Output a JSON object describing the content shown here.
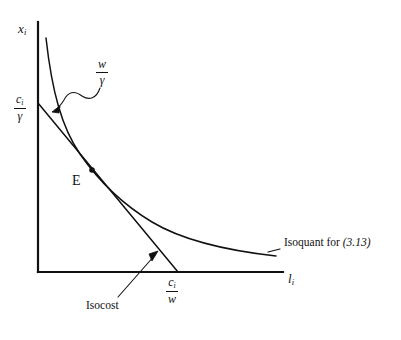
{
  "figure": {
    "background_color": "#ffffff",
    "line_color": "#111111",
    "width": 401,
    "height": 340
  },
  "axes": {
    "y_axis_label": "x",
    "y_axis_subscript": "i",
    "x_axis_label": "l",
    "x_axis_subscript": "i",
    "origin": {
      "x": 38,
      "y": 272
    },
    "x_axis_end": {
      "x": 283,
      "y": 272
    },
    "y_axis_top": {
      "x": 38,
      "y": 22
    }
  },
  "intercepts": {
    "vertical": {
      "numerator": "c",
      "numerator_subscript": "i",
      "denominator": "γ",
      "value_label": "c_i/γ",
      "position": {
        "x": 14,
        "y": 95
      }
    },
    "horizontal": {
      "numerator": "c",
      "numerator_subscript": "i",
      "denominator": "w",
      "value_label": "c_i/w",
      "position": {
        "x": 166,
        "y": 277
      }
    }
  },
  "slope_annotation": {
    "numerator": "w",
    "denominator": "γ",
    "value_label": "w/γ",
    "position": {
      "x": 96,
      "y": 60
    },
    "points_to": {
      "x": 53,
      "y": 110
    }
  },
  "equilibrium_point": {
    "label": "E",
    "marker": "filled-dot",
    "dot": {
      "x": 92,
      "y": 170
    },
    "label_position": {
      "x": 72,
      "y": 180
    }
  },
  "curves": [
    {
      "name": "isoquant",
      "label": "Isoquant for",
      "equation_reference": "(3.13)",
      "label_position": {
        "x": 283,
        "y": 243
      },
      "shape": "convex-hyperbola",
      "start": {
        "x": 46,
        "y": 38
      },
      "end": {
        "x": 276,
        "y": 256
      }
    },
    {
      "name": "isocost",
      "label": "Isocost",
      "label_position": {
        "x": 86,
        "y": 305
      },
      "shape": "straight-line",
      "start": {
        "x": 38,
        "y": 103
      },
      "end": {
        "x": 178,
        "y": 272
      },
      "pointer_to": {
        "x": 152,
        "y": 252
      }
    }
  ]
}
